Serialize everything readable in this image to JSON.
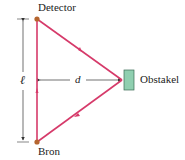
{
  "labels": {
    "top": "Detector",
    "bottom": "Bron",
    "right": "Obstakel",
    "length": "ℓ",
    "distance": "d"
  },
  "colors": {
    "ray": "#d63a6a",
    "dot": "#b5652e",
    "obstacle_fill": "#8fcfb0",
    "obstacle_stroke": "#3a6b55",
    "dim": "#333333"
  }
}
